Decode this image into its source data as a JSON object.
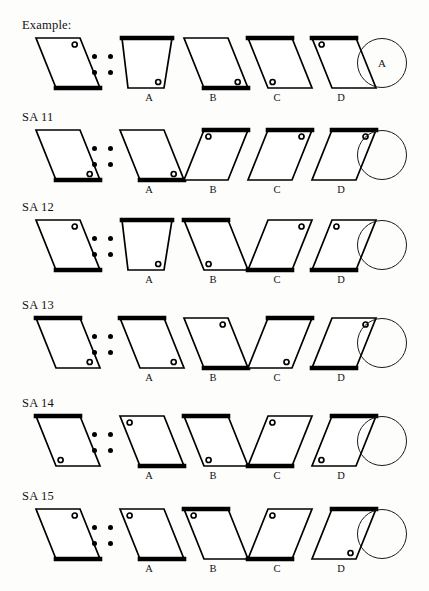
{
  "page": {
    "background_color": "#fdfdfc",
    "ink_color": "#000000"
  },
  "separator": {
    "name": "four-dot-analogy-separator",
    "dot_count": 4
  },
  "rows": [
    {
      "id": "example",
      "label": "Example:",
      "answer": "A",
      "prompt": {
        "name": "prompt-shape",
        "skew": "right",
        "thick_edge": "bottom",
        "dot": "top-right",
        "lean": 1
      },
      "options": [
        {
          "letter": "A",
          "skew": "trapezoid-right",
          "thick_edge": "top",
          "dot": "bottom-right",
          "lean": 2
        },
        {
          "letter": "B",
          "skew": "right",
          "thick_edge": "bottom",
          "dot": "bottom-right",
          "lean": 1
        },
        {
          "letter": "C",
          "skew": "right",
          "thick_edge": "top",
          "dot": "bottom-left",
          "lean": 1
        },
        {
          "letter": "D",
          "skew": "right",
          "thick_edge": "top",
          "dot": "top-left",
          "lean": 1
        }
      ]
    },
    {
      "id": "sa11",
      "label": "SA 11",
      "answer": "",
      "prompt": {
        "name": "prompt-shape",
        "skew": "right",
        "thick_edge": "bottom",
        "dot": "bottom-right",
        "lean": 1
      },
      "options": [
        {
          "letter": "A",
          "skew": "right",
          "thick_edge": "bottom",
          "dot": "bottom-right",
          "lean": 1
        },
        {
          "letter": "B",
          "skew": "left",
          "thick_edge": "top",
          "dot": "top-left",
          "lean": 1
        },
        {
          "letter": "C",
          "skew": "left",
          "thick_edge": "top",
          "dot": "top-right",
          "lean": 1
        },
        {
          "letter": "D",
          "skew": "left",
          "thick_edge": "top",
          "dot": "top-right",
          "lean": 1
        }
      ]
    },
    {
      "id": "sa12",
      "label": "SA 12",
      "answer": "",
      "prompt": {
        "name": "prompt-shape",
        "skew": "right",
        "thick_edge": "bottom",
        "dot": "top-right",
        "lean": 1
      },
      "options": [
        {
          "letter": "A",
          "skew": "trapezoid-right",
          "thick_edge": "top",
          "dot": "bottom-right",
          "lean": 2
        },
        {
          "letter": "B",
          "skew": "right",
          "thick_edge": "top",
          "dot": "bottom-left",
          "lean": 1
        },
        {
          "letter": "C",
          "skew": "left",
          "thick_edge": "bottom",
          "dot": "top-right",
          "lean": 1
        },
        {
          "letter": "D",
          "skew": "left",
          "thick_edge": "bottom",
          "dot": "top-left",
          "lean": 1
        }
      ]
    },
    {
      "id": "sa13",
      "label": "SA 13",
      "answer": "",
      "prompt": {
        "name": "prompt-shape",
        "skew": "right",
        "thick_edge": "top",
        "dot": "bottom-right",
        "lean": 1
      },
      "options": [
        {
          "letter": "A",
          "skew": "right",
          "thick_edge": "top",
          "dot": "bottom-right",
          "lean": 1
        },
        {
          "letter": "B",
          "skew": "right",
          "thick_edge": "bottom",
          "dot": "top-right",
          "lean": 1
        },
        {
          "letter": "C",
          "skew": "left",
          "thick_edge": "top",
          "dot": "bottom-right",
          "lean": 1
        },
        {
          "letter": "D",
          "skew": "left",
          "thick_edge": "bottom",
          "dot": "top-right",
          "lean": 1
        }
      ]
    },
    {
      "id": "sa14",
      "label": "SA 14",
      "answer": "",
      "prompt": {
        "name": "prompt-shape",
        "skew": "right",
        "thick_edge": "top",
        "dot": "bottom-left",
        "lean": 1
      },
      "options": [
        {
          "letter": "A",
          "skew": "right",
          "thick_edge": "bottom",
          "dot": "top-left",
          "lean": 1
        },
        {
          "letter": "B",
          "skew": "right",
          "thick_edge": "top",
          "dot": "bottom-left",
          "lean": 1
        },
        {
          "letter": "C",
          "skew": "left",
          "thick_edge": "bottom",
          "dot": "top-left",
          "lean": 1
        },
        {
          "letter": "D",
          "skew": "left",
          "thick_edge": "top",
          "dot": "bottom-left",
          "lean": 1
        }
      ]
    },
    {
      "id": "sa15",
      "label": "SA 15",
      "answer": "",
      "prompt": {
        "name": "prompt-shape",
        "skew": "right",
        "thick_edge": "bottom",
        "dot": "top-right",
        "lean": 1
      },
      "options": [
        {
          "letter": "A",
          "skew": "right",
          "thick_edge": "bottom",
          "dot": "top-left",
          "lean": 1
        },
        {
          "letter": "B",
          "skew": "right",
          "thick_edge": "top",
          "dot": "top-left",
          "lean": 1
        },
        {
          "letter": "C",
          "skew": "left",
          "thick_edge": "bottom",
          "dot": "top-left",
          "lean": 1
        },
        {
          "letter": "D",
          "skew": "left",
          "thick_edge": "top",
          "dot": "bottom-right",
          "lean": 1
        }
      ]
    }
  ],
  "layout": {
    "row_tops": [
      18,
      110,
      200,
      298,
      396,
      489
    ],
    "prompt_x": 28,
    "dots_x": 92,
    "option_xs": [
      112,
      176,
      240,
      304
    ],
    "circle_x": 357,
    "shape_width": 74,
    "shape_height": 62
  }
}
